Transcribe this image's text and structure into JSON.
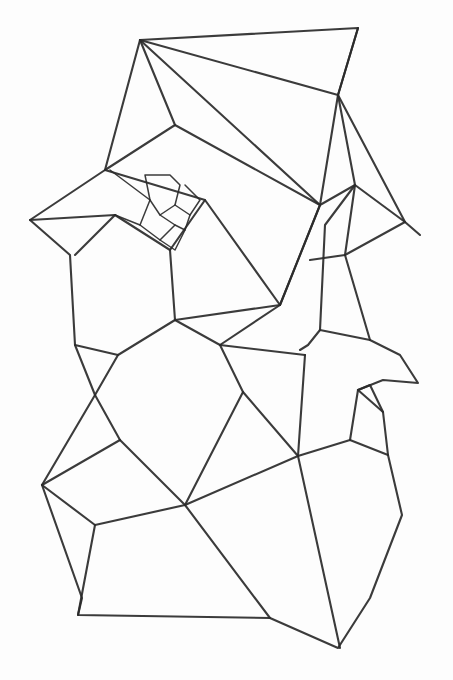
{
  "artwork": {
    "title": "Pencil sketch of polygonal (Voronoi-like) cell mesh",
    "medium": "graphite line drawing on white paper",
    "background_color": "#fdfdfd",
    "line_color": "#2a2a2a"
  },
  "polylines": [
    "140,40 358,28 338,95 405,222 420,235",
    "140,40 105,170 30,220 70,255 75,345 95,395 42,485 82,598 78,615 270,618 338,648 370,598 402,515 388,455 383,412 358,390 383,380 418,383 400,355 370,340 345,335 320,330 308,345 300,350",
    "140,40 320,205 355,185 405,222",
    "140,40 175,125 105,170",
    "140,40 338,95 320,205",
    "358,28 338,95",
    "175,125 320,205 280,305",
    "105,170 205,200 280,305 320,205",
    "30,220 115,215 170,250 205,200",
    "115,215 75,255",
    "170,250 175,320 280,305",
    "175,320 118,355 95,395",
    "118,355 75,345",
    "175,320 220,345 280,305",
    "220,345 305,355",
    "220,345 243,392 185,505",
    "243,392 298,456",
    "298,456 305,355",
    "298,456 350,440 388,455",
    "298,456 185,505 120,440",
    "120,440 95,395",
    "120,440 42,485",
    "42,485 95,525 185,505",
    "95,525 78,615",
    "185,505 270,618",
    "298,456 340,648",
    "355,185 325,225 320,330",
    "338,95 355,185",
    "345,255 370,340",
    "355,185 345,255 405,222",
    "345,255 310,260",
    "358,390 350,440",
    "383,412 370,385 358,390"
  ],
  "web_detail": [
    "145,175 150,200 160,215 175,205 180,185 170,175 145,175",
    "150,200 140,225 160,240 175,225 160,215",
    "175,205 190,215 185,230 175,225",
    "185,185 200,200 190,215",
    "160,240 175,250 185,230",
    "110,170 150,200",
    "140,225 115,215"
  ]
}
